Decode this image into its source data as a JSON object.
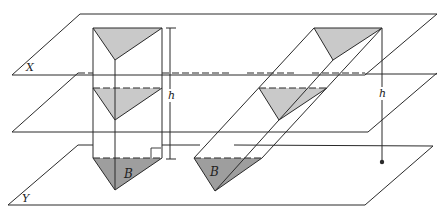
{
  "diagram": {
    "planes": {
      "top": {
        "label": "X"
      },
      "bottom": {
        "label": "Y"
      }
    },
    "right_prism": {
      "base_label": "B",
      "height_label": "h",
      "right_angle_marker": true
    },
    "oblique_prism": {
      "base_label": "B",
      "height_label": "h"
    },
    "colors": {
      "line": "#2a2a2a",
      "cross_section_fill": "#c9c9c9",
      "base_fill": "#9e9e9e",
      "background": "#ffffff"
    }
  }
}
